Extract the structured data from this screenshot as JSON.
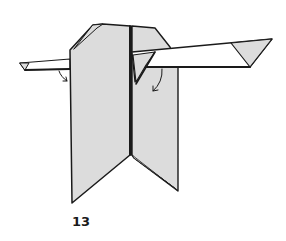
{
  "diagram": {
    "step_number": "13",
    "colors": {
      "paper_shaded": "#dcdcdc",
      "paper_white": "#ffffff",
      "outline": "#1a1a1a"
    },
    "parts": [
      {
        "name": "left-panel",
        "fill": "shaded"
      },
      {
        "name": "right-panel",
        "fill": "shaded"
      },
      {
        "name": "left-wing",
        "fill": "white",
        "tip": "shaded-triangle"
      },
      {
        "name": "right-wing",
        "fill": "white",
        "tip": "shaded-triangle"
      }
    ],
    "arrows": [
      {
        "name": "left-fold-arrow",
        "direction": "down-curve"
      },
      {
        "name": "right-fold-arrow",
        "direction": "down-curve"
      }
    ]
  }
}
